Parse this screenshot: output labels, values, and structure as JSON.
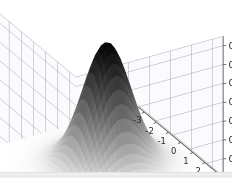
{
  "figure": {
    "background_color": "#ffffff",
    "axis_color": "#555555",
    "grid_color": "#9aa0b0",
    "pane_color": "#fbfbfd",
    "tick_text_color": "#2b2b2b"
  },
  "chart_data": {
    "type": "surface",
    "title": "",
    "xlabel": "",
    "ylabel": "",
    "zlabel": "",
    "colormap": "gray_r",
    "grid": true,
    "legend": null,
    "projection": "3d",
    "view": {
      "elevation": 30,
      "azimuth": -60
    },
    "xlim": [
      -3.5,
      3.5
    ],
    "ylim": [
      -3.5,
      3.5
    ],
    "zlim": [
      0.0,
      0.1875
    ],
    "x_ticks": [
      -3,
      -2,
      -1,
      0,
      1,
      2,
      3
    ],
    "x_tick_labels": [
      "-3",
      "-2",
      "-1",
      "0",
      "1",
      "2",
      "3"
    ],
    "y_ticks": [
      -3,
      -2,
      -1,
      0,
      1,
      2,
      3
    ],
    "y_tick_labels": [
      "-3",
      "-2",
      "-1",
      "0",
      "1",
      "2",
      "3"
    ],
    "z_ticks": [
      0.025,
      0.05,
      0.075,
      0.1,
      0.125,
      0.15,
      0.175
    ],
    "z_tick_labels": [
      "0.025",
      "0.050",
      "0.075",
      "0.100",
      "0.125",
      "0.150",
      "0.175"
    ],
    "surface": {
      "function": "bivariate gaussian pdf",
      "peak_value": 0.1592,
      "peak_x": 0.0,
      "peak_y": 0.0,
      "sigma_x": 1.0,
      "sigma_y": 1.0,
      "n_grid": 40
    }
  }
}
